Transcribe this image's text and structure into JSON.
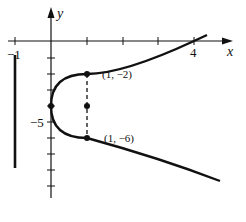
{
  "figure": {
    "type": "parabola graph",
    "equation_form": "x = (y + 4)^2 / 4",
    "axes": {
      "x_label": "x",
      "y_label": "y",
      "x_tick_labels": [
        {
          "value": -1,
          "text": "−1"
        },
        {
          "value": 4,
          "text": "4"
        }
      ],
      "y_tick_labels": [
        {
          "value": -5,
          "text": "−5"
        }
      ]
    },
    "vertical_line": {
      "x": -1,
      "description": "directrix x = -1"
    },
    "points": [
      {
        "x": 1,
        "y": -2,
        "label": "(1, −2)"
      },
      {
        "x": 1,
        "y": -6,
        "label": "(1, −6)"
      },
      {
        "x": 0,
        "y": -4,
        "label": ""
      },
      {
        "x": 1,
        "y": -4,
        "label": ""
      }
    ],
    "dashed_segment": {
      "from": [
        1,
        -2
      ],
      "to": [
        1,
        -6
      ]
    },
    "colors": {
      "ink": "#111111",
      "background": "#ffffff"
    }
  }
}
